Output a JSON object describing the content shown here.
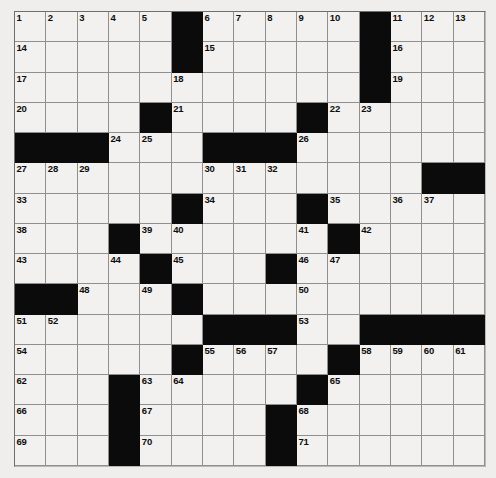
{
  "puzzle": {
    "kind": "crossword-grid",
    "rows": 15,
    "columns": 15,
    "colors": {
      "page_background": "#efefed",
      "cell_fill": "#f2f1ef",
      "block_fill": "#0b0b0b",
      "grid_line": "#8f8f8f",
      "number_color": "#0d0d0d"
    },
    "blocks": [
      [
        1,
        6
      ],
      [
        1,
        12
      ],
      [
        2,
        6
      ],
      [
        2,
        12
      ],
      [
        3,
        12
      ],
      [
        4,
        5
      ],
      [
        4,
        10
      ],
      [
        5,
        1
      ],
      [
        5,
        2
      ],
      [
        5,
        3
      ],
      [
        5,
        7
      ],
      [
        5,
        8
      ],
      [
        5,
        9
      ],
      [
        6,
        14
      ],
      [
        6,
        15
      ],
      [
        7,
        6
      ],
      [
        7,
        10
      ],
      [
        8,
        4
      ],
      [
        8,
        11
      ],
      [
        9,
        5
      ],
      [
        9,
        9
      ],
      [
        10,
        1
      ],
      [
        10,
        2
      ],
      [
        10,
        6
      ],
      [
        11,
        7
      ],
      [
        11,
        8
      ],
      [
        11,
        9
      ],
      [
        11,
        12
      ],
      [
        11,
        13
      ],
      [
        11,
        14
      ],
      [
        11,
        15
      ],
      [
        12,
        6
      ],
      [
        12,
        11
      ],
      [
        13,
        4
      ],
      [
        13,
        10
      ],
      [
        14,
        4
      ],
      [
        14,
        9
      ],
      [
        15,
        4
      ],
      [
        15,
        9
      ]
    ],
    "numbers": [
      {
        "n": "1",
        "row": 1,
        "col": 1
      },
      {
        "n": "2",
        "row": 1,
        "col": 2
      },
      {
        "n": "3",
        "row": 1,
        "col": 3
      },
      {
        "n": "4",
        "row": 1,
        "col": 4
      },
      {
        "n": "5",
        "row": 1,
        "col": 5
      },
      {
        "n": "6",
        "row": 1,
        "col": 7
      },
      {
        "n": "7",
        "row": 1,
        "col": 8
      },
      {
        "n": "8",
        "row": 1,
        "col": 9
      },
      {
        "n": "9",
        "row": 1,
        "col": 10
      },
      {
        "n": "10",
        "row": 1,
        "col": 11
      },
      {
        "n": "11",
        "row": 1,
        "col": 13
      },
      {
        "n": "12",
        "row": 1,
        "col": 14
      },
      {
        "n": "13",
        "row": 1,
        "col": 15
      },
      {
        "n": "14",
        "row": 2,
        "col": 1
      },
      {
        "n": "15",
        "row": 2,
        "col": 7
      },
      {
        "n": "16",
        "row": 2,
        "col": 13
      },
      {
        "n": "17",
        "row": 3,
        "col": 1
      },
      {
        "n": "18",
        "row": 3,
        "col": 6
      },
      {
        "n": "19",
        "row": 3,
        "col": 13
      },
      {
        "n": "20",
        "row": 4,
        "col": 1
      },
      {
        "n": "21",
        "row": 4,
        "col": 6
      },
      {
        "n": "22",
        "row": 4,
        "col": 11
      },
      {
        "n": "23",
        "row": 4,
        "col": 12
      },
      {
        "n": "24",
        "row": 5,
        "col": 4
      },
      {
        "n": "25",
        "row": 5,
        "col": 5
      },
      {
        "n": "26",
        "row": 5,
        "col": 10
      },
      {
        "n": "27",
        "row": 6,
        "col": 1
      },
      {
        "n": "28",
        "row": 6,
        "col": 2
      },
      {
        "n": "29",
        "row": 6,
        "col": 3
      },
      {
        "n": "30",
        "row": 6,
        "col": 7
      },
      {
        "n": "31",
        "row": 6,
        "col": 8
      },
      {
        "n": "32",
        "row": 6,
        "col": 9
      },
      {
        "n": "33",
        "row": 7,
        "col": 1
      },
      {
        "n": "34",
        "row": 7,
        "col": 7
      },
      {
        "n": "35",
        "row": 7,
        "col": 11
      },
      {
        "n": "36",
        "row": 7,
        "col": 13
      },
      {
        "n": "37",
        "row": 7,
        "col": 14
      },
      {
        "n": "38",
        "row": 8,
        "col": 1
      },
      {
        "n": "39",
        "row": 8,
        "col": 5
      },
      {
        "n": "40",
        "row": 8,
        "col": 6
      },
      {
        "n": "41",
        "row": 8,
        "col": 10
      },
      {
        "n": "42",
        "row": 8,
        "col": 12
      },
      {
        "n": "43",
        "row": 9,
        "col": 1
      },
      {
        "n": "44",
        "row": 9,
        "col": 4
      },
      {
        "n": "45",
        "row": 9,
        "col": 6
      },
      {
        "n": "46",
        "row": 9,
        "col": 10
      },
      {
        "n": "47",
        "row": 9,
        "col": 11
      },
      {
        "n": "48",
        "row": 10,
        "col": 3
      },
      {
        "n": "49",
        "row": 10,
        "col": 5
      },
      {
        "n": "50",
        "row": 10,
        "col": 10
      },
      {
        "n": "51",
        "row": 11,
        "col": 1
      },
      {
        "n": "52",
        "row": 11,
        "col": 2
      },
      {
        "n": "53",
        "row": 11,
        "col": 10
      },
      {
        "n": "54",
        "row": 12,
        "col": 1
      },
      {
        "n": "55",
        "row": 12,
        "col": 7
      },
      {
        "n": "56",
        "row": 12,
        "col": 8
      },
      {
        "n": "57",
        "row": 12,
        "col": 9
      },
      {
        "n": "58",
        "row": 12,
        "col": 12
      },
      {
        "n": "59",
        "row": 12,
        "col": 13
      },
      {
        "n": "60",
        "row": 12,
        "col": 14
      },
      {
        "n": "61",
        "row": 12,
        "col": 15
      },
      {
        "n": "62",
        "row": 13,
        "col": 1
      },
      {
        "n": "63",
        "row": 13,
        "col": 5
      },
      {
        "n": "64",
        "row": 13,
        "col": 6
      },
      {
        "n": "65",
        "row": 13,
        "col": 11
      },
      {
        "n": "66",
        "row": 14,
        "col": 1
      },
      {
        "n": "67",
        "row": 14,
        "col": 5
      },
      {
        "n": "68",
        "row": 14,
        "col": 10
      },
      {
        "n": "69",
        "row": 15,
        "col": 1
      },
      {
        "n": "70",
        "row": 15,
        "col": 5
      },
      {
        "n": "71",
        "row": 15,
        "col": 10
      }
    ],
    "entries": []
  }
}
